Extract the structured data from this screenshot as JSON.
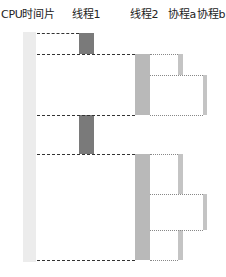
{
  "header": {
    "cpu_label": "CPU时间片",
    "thread1_label": "线程1",
    "thread2_label": "线程2",
    "coroutine_a_label": "协程a",
    "coroutine_b_label": "协程b"
  },
  "colors": {
    "cpu": "#ececec",
    "thread1": "#7a7a7a",
    "thread2": "#b9b9b9",
    "coroutine": "#c4c4c4",
    "dash": "#333333",
    "dot": "#888888"
  }
}
